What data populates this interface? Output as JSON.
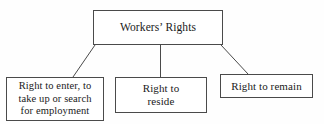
{
  "diagram": {
    "type": "tree",
    "background_color": "#fefefe",
    "line_color": "#4a4a4a",
    "text_color": "#1a1a1a",
    "root": {
      "id": "root",
      "label": "Workers’ Rights"
    },
    "children": [
      {
        "id": "enter",
        "label": "Right to enter, to\ntake up or search\nfor employment"
      },
      {
        "id": "reside",
        "label": "Right to\nreside"
      },
      {
        "id": "remain",
        "label": "Right to remain"
      }
    ],
    "connectors": [
      {
        "from": "root",
        "to": "enter",
        "style": "diagonal"
      },
      {
        "from": "root",
        "to": "reside",
        "style": "vertical"
      },
      {
        "from": "root",
        "to": "remain",
        "style": "diagonal"
      }
    ]
  }
}
